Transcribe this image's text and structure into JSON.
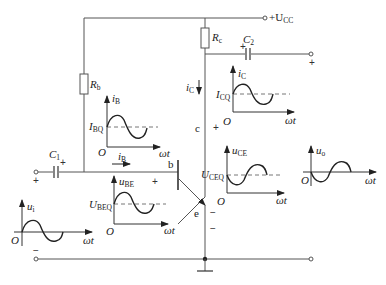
{
  "diagram": {
    "type": "common-emitter amplifier circuit with waveforms",
    "supply": {
      "label": "+U",
      "sub": "CC"
    },
    "components": {
      "Rb": {
        "label": "R",
        "sub": "b"
      },
      "Rc": {
        "label": "R",
        "sub": "c"
      },
      "C1": {
        "label": "C",
        "sub": "1"
      },
      "C2": {
        "label": "C",
        "sub": "2"
      }
    },
    "terminals": {
      "b": "b",
      "c": "c",
      "e": "e"
    },
    "currents": {
      "iC_arrow": {
        "label": "i",
        "sub": "C"
      },
      "iB_arrow": {
        "label": "i",
        "sub": "B"
      }
    },
    "polarity": {
      "plus": "+",
      "minus": "−"
    },
    "graphs": [
      {
        "name": "iB",
        "ylabel": "i",
        "ysub": "B",
        "dc": "I",
        "dcsub": "BQ",
        "origin": "O",
        "xlabel": "ωt"
      },
      {
        "name": "iC",
        "ylabel": "i",
        "ysub": "C",
        "dc": "I",
        "dcsub": "CQ",
        "origin": "O",
        "xlabel": "ωt"
      },
      {
        "name": "uBE",
        "ylabel": "u",
        "ysub": "BE",
        "dc": "U",
        "dcsub": "BEQ",
        "origin": "O",
        "xlabel": "ωt"
      },
      {
        "name": "uCE",
        "ylabel": "u",
        "ysub": "CE",
        "dc": "U",
        "dcsub": "CEQ",
        "origin": "O",
        "xlabel": "ωt"
      },
      {
        "name": "ui",
        "ylabel": "u",
        "ysub": "i",
        "origin": "O",
        "xlabel": "ωt"
      },
      {
        "name": "uo",
        "ylabel": "u",
        "ysub": "o",
        "origin": "O",
        "xlabel": "ωt"
      }
    ]
  }
}
